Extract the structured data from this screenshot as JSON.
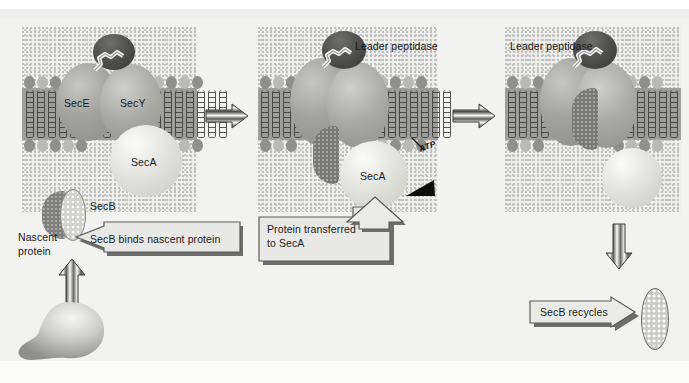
{
  "figure": {
    "background_color": "#f2f2f0",
    "membrane_color": "#9e9e9c"
  },
  "panels": [
    {
      "id": "panel-1",
      "stage_name": "secb-delivers-nascent-protein",
      "labels": {
        "secE": "SecE",
        "secY": "SecY",
        "secA": "SecA"
      }
    },
    {
      "id": "panel-2",
      "stage_name": "protein-transferred-to-seca",
      "labels": {
        "leader_peptidase": "Leader peptidase",
        "secA": "SecA",
        "atp": "ATP"
      }
    },
    {
      "id": "panel-3",
      "stage_name": "translocation-and-secb-recycling",
      "labels": {
        "leader_peptidase": "Leader peptidase"
      }
    }
  ],
  "annotations": {
    "secB_label": "SecB",
    "nascent_protein_label_line1": "Nascent",
    "nascent_protein_label_line2": "protein",
    "secb_binds_callout": "SecB binds nascent protein",
    "protein_transferred_callout_line1": "Protein transferred",
    "protein_transferred_callout_line2": "to SecA",
    "secb_recycles_callout": "SecB recycles"
  },
  "icons": {
    "transition_arrow_1": "striped-right-arrow-icon",
    "transition_arrow_2": "striped-right-arrow-icon",
    "up_arrow": "striped-up-arrow-icon",
    "down_arrow": "striped-down-arrow-icon",
    "atp_pointer": "black-triangle-icon",
    "secb_binds_arrow": "left-pointing-callout-arrow-icon",
    "protein_transferred_arrow": "up-pointing-callout-arrow-icon",
    "secb_recycles_arrow": "right-pointing-callout-arrow-icon"
  },
  "colors": {
    "membrane": "#9e9e9c",
    "lipid_head_dark": "#8f8f8d",
    "lipid_head_light": "#b9b9b7",
    "leader_peptidase": "#4c4c4a",
    "secA": "#e3e3df",
    "secE": "#a3a3a0",
    "secY": "#a9a9a5",
    "callout_fill": "#e8e8e6",
    "callout_border": "#6a6a68"
  }
}
